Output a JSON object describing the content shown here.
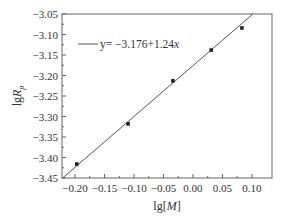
{
  "chart_data": {
    "type": "scatter",
    "title": "",
    "xlabel": "lg[M]",
    "xlabel_parts": {
      "prefix": "lg[",
      "italic": "M",
      "suffix": "]"
    },
    "ylabel": "lgRp",
    "ylabel_parts": {
      "prefix": "lg",
      "italic": "R",
      "sub": "p"
    },
    "xlim": [
      -0.222,
      0.134
    ],
    "ylim": [
      -3.45,
      -3.05
    ],
    "xticks": [
      -0.2,
      -0.15,
      -0.1,
      -0.05,
      0.0,
      0.05,
      0.1
    ],
    "xtick_labels": [
      "−0.20",
      "−0.15",
      "−0.10",
      "−0.05",
      "0.00",
      "0.05",
      "0.10"
    ],
    "yticks": [
      -3.05,
      -3.1,
      -3.15,
      -3.2,
      -3.25,
      -3.3,
      -3.35,
      -3.4,
      -3.45
    ],
    "ytick_labels": [
      "−3.05",
      "−3.10",
      "−3.15",
      "−3.20",
      "−3.25",
      "−3.30",
      "−3.35",
      "−3.40",
      "−3.45"
    ],
    "grid": false,
    "series": [
      {
        "name": "data",
        "type": "scatter",
        "marker": "square",
        "x": [
          -0.197,
          -0.11,
          -0.034,
          0.031,
          0.083
        ],
        "y": [
          -3.416,
          -3.318,
          -3.213,
          -3.138,
          -3.084
        ]
      },
      {
        "name": "fit",
        "type": "line",
        "intercept": -3.176,
        "slope": 1.24
      }
    ],
    "legend": {
      "position": "upper left",
      "entries": [
        {
          "label_prefix": "y= −3.176+1.24",
          "label_italic": "x"
        }
      ]
    }
  }
}
